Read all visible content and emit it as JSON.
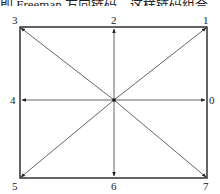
{
  "header": {
    "text": "即 Freeman 方向链码。这样链码组合"
  },
  "diagram": {
    "labels": {
      "d0": "0",
      "d1": "1",
      "d2": "2",
      "d3": "3",
      "d4": "4",
      "d5": "5",
      "d6": "6",
      "d7": "7"
    },
    "colors": {
      "frame": "#111111",
      "arrows": "#555555",
      "center": "#111111"
    }
  }
}
